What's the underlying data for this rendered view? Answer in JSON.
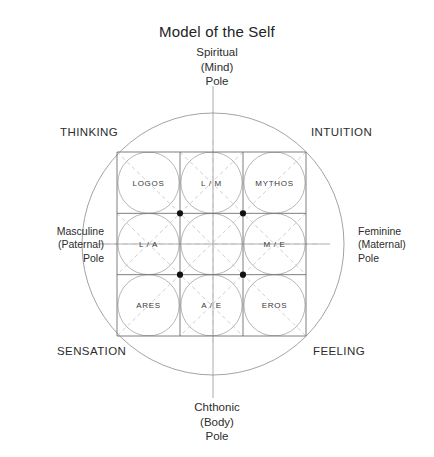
{
  "title": "Model of the Self",
  "poles": {
    "top": "Spiritual\n(Mind)\nPole",
    "bottom": "Chthonic\n(Body)\nPole",
    "left": "Masculine\n(Paternal)\nPole",
    "right": "Feminine\n(Maternal)\nPole"
  },
  "functions": {
    "top_left": "THINKING",
    "top_right": "INTUITION",
    "bottom_left": "SENSATION",
    "bottom_right": "FEELING"
  },
  "grid": {
    "rows": [
      [
        "LOGOS",
        "L / M",
        "MYTHOS"
      ],
      [
        "L / A",
        "",
        "M / E"
      ],
      [
        "ARES",
        "A / E",
        "EROS"
      ]
    ]
  },
  "colors": {
    "line": "#6f6f6f",
    "thin_line": "#9a9a9a",
    "dashed": "#b4b4b4",
    "dot": "#111111",
    "text": "#2d2d2d",
    "background": "#ffffff"
  }
}
